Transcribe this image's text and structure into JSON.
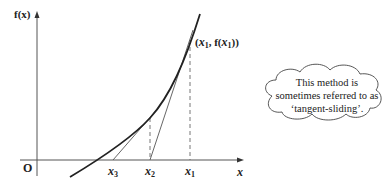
{
  "diagram": {
    "y_axis_label": "f(x)",
    "x_axis_label": "x",
    "origin_label": "O",
    "point_label": {
      "open": "(",
      "x": "x",
      "x_sub": "1",
      "sep": ", f(",
      "x2": "x",
      "x2_sub": "1",
      "close": "))"
    },
    "x_ticks": [
      {
        "name": "x",
        "sub": "3"
      },
      {
        "name": "x",
        "sub": "2"
      },
      {
        "name": "x",
        "sub": "1"
      }
    ],
    "note": {
      "line1": "This method is",
      "line2": "sometimes referred to as",
      "line3": "‘tangent-sliding’."
    },
    "colors": {
      "curve": "#222222",
      "axis": "#555555",
      "tangent": "#555555",
      "dashed": "#666666"
    }
  }
}
